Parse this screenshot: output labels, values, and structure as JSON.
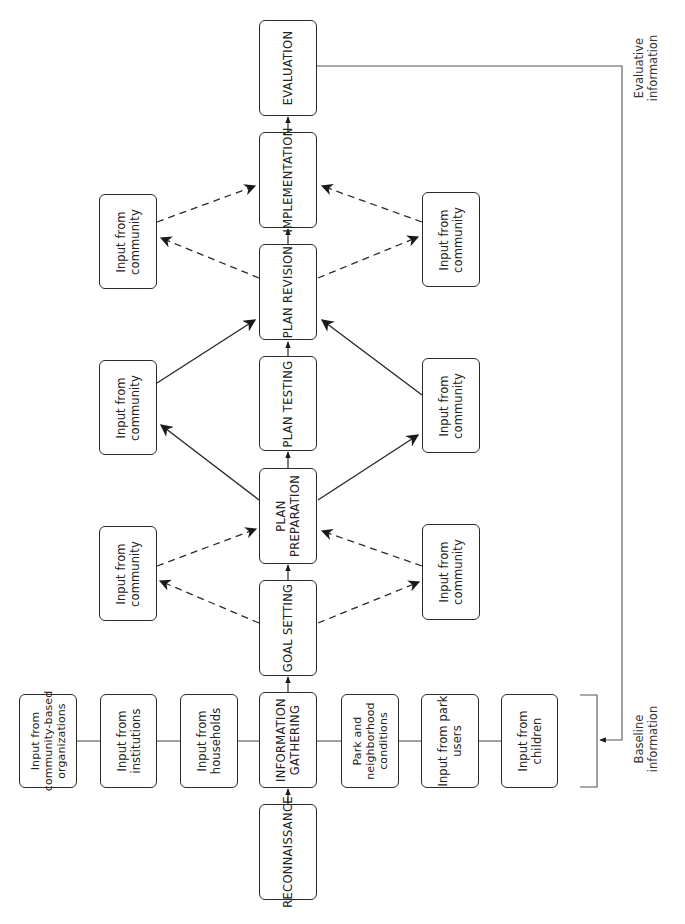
{
  "diagram": {
    "orientation": "rotated-90-ccw",
    "colors": {
      "stroke": "#2a2a2a",
      "feedback_line": "#555555",
      "background": "#ffffff"
    },
    "main_stages": [
      {
        "id": "evaluation",
        "label": "EVALUATION"
      },
      {
        "id": "implementation",
        "label": "IMPLEMENTATION"
      },
      {
        "id": "plan-revision",
        "label": "PLAN REVISION"
      },
      {
        "id": "plan-testing",
        "label": "PLAN TESTING"
      },
      {
        "id": "plan-preparation",
        "label": "PLAN\nPREPARATION"
      },
      {
        "id": "goal-setting",
        "label": "GOAL SETTING"
      },
      {
        "id": "information-gathering",
        "label": "INFORMATION\nGATHERING"
      },
      {
        "id": "reconnaissance",
        "label": "RECONNAISSANCE"
      }
    ],
    "community_inputs": {
      "left": [
        {
          "label": "Input from\ncommunity"
        },
        {
          "label": "Input from\ncommunity"
        },
        {
          "label": "Input from\ncommunity"
        }
      ],
      "right": [
        {
          "label": "Input from\ncommunity"
        },
        {
          "label": "Input from\ncommunity"
        },
        {
          "label": "Input from\ncommunity"
        }
      ]
    },
    "information_inputs": [
      {
        "label": "Input from\ncommunity-based\norganizations"
      },
      {
        "label": "Input from\ninstitutions"
      },
      {
        "label": "Input from\nhouseholds"
      },
      {
        "label": "Park and\nneighborhood\nconditions"
      },
      {
        "label": "Input from park\nusers"
      },
      {
        "label": "Input from\nchildren"
      }
    ],
    "annotations": {
      "evaluative": "Evaluative\ninformation",
      "baseline": "Baseline\ninformation"
    }
  }
}
